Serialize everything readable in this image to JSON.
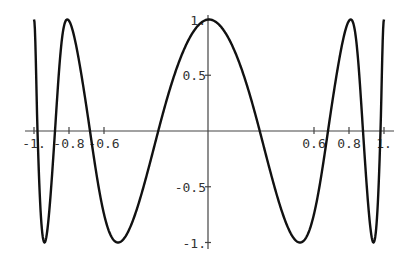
{
  "chart_data": {
    "type": "line",
    "title": "",
    "xlabel": "",
    "ylabel": "",
    "xlim": [
      -1,
      1
    ],
    "ylim": [
      -1,
      1
    ],
    "grid": false,
    "legend": "none",
    "x_ticks": [
      {
        "value": -1,
        "label": "-1."
      },
      {
        "value": -0.8,
        "label": "-0.8"
      },
      {
        "value": -0.6,
        "label": "-0.6"
      },
      {
        "value": 0.6,
        "label": "0.6"
      },
      {
        "value": 0.8,
        "label": "0.8"
      },
      {
        "value": 1,
        "label": "1."
      }
    ],
    "y_ticks": [
      {
        "value": 1,
        "label": "1."
      },
      {
        "value": 0.5,
        "label": "0.5"
      },
      {
        "value": -0.5,
        "label": "-0.5"
      },
      {
        "value": -1,
        "label": "-1."
      }
    ],
    "series": [
      {
        "name": "f(x)",
        "color": "#111111",
        "description": "even oscillating function, cos of an accelerating phase",
        "x": [
          -1.0,
          -0.98,
          -0.94,
          -0.88,
          -0.81,
          -0.68,
          -0.52,
          -0.29,
          0.0,
          0.29,
          0.52,
          0.68,
          0.81,
          0.88,
          0.94,
          0.98,
          1.0
        ],
        "y": [
          1.0,
          0.0,
          -1.0,
          0.0,
          1.0,
          0.0,
          -1.0,
          0.0,
          1.0,
          0.0,
          -1.0,
          0.0,
          1.0,
          0.0,
          -1.0,
          0.0,
          1.0
        ]
      }
    ]
  }
}
